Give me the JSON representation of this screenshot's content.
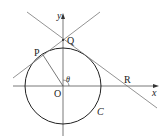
{
  "figure": {
    "type": "geometry",
    "labels": {
      "y_axis": "y",
      "x_axis": "x",
      "origin": "O",
      "point_P": "P",
      "point_Q": "Q",
      "point_R": "R",
      "angle": "θ",
      "circle": "C"
    },
    "colors": {
      "axis": "#555555",
      "circle": "#222222",
      "lines": "#666666"
    }
  }
}
